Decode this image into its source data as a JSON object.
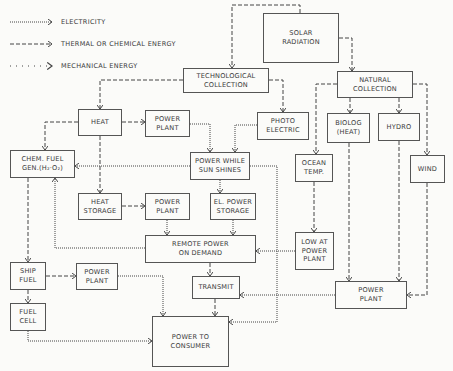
{
  "legend": [
    {
      "style": "electric",
      "label": "ELECTRICITY"
    },
    {
      "style": "thermal",
      "label": "THERMAL OR CHEMICAL ENERGY"
    },
    {
      "style": "mechanical",
      "label": "MECHANICAL ENERGY"
    }
  ],
  "nodes": {
    "solar": "SOLAR\nRADIATION",
    "tech": "TECHNOLOGICAL\nCOLLECTION",
    "natural": "NATURAL\nCOLLECTION",
    "heat": "HEAT",
    "pp1": "POWER\nPLANT",
    "photo": "PHOTO\nELECTRIC",
    "chem": "CHEM. FUEL\nGEN.(H₂·O₂)",
    "pws": "POWER WHILE\nSUN SHINES",
    "biolog": "BIOLOG\n(HEAT)",
    "hydro": "HYDRO",
    "ocean": "OCEAN\nTEMP.",
    "wind": "WIND",
    "hstore": "HEAT\nSTORAGE",
    "pp2": "POWER\nPLANT",
    "elstore": "EL. POWER\nSTORAGE",
    "remote": "REMOTE POWER\nON DEMAND",
    "lowat": "LOW AT\nPOWER\nPLANT",
    "ship": "SHIP\nFUEL",
    "pp3": "POWER\nPLANT",
    "transmit": "TRANSMIT",
    "pp4": "POWER\nPLANT",
    "fuelcell": "FUEL\nCELL",
    "consumer": "POWER TO\nCONSUMER"
  }
}
